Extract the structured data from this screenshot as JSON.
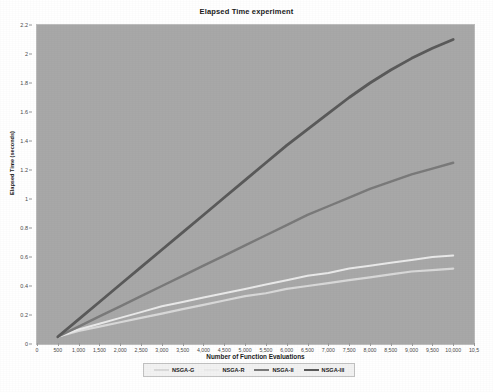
{
  "chart_data": {
    "type": "line",
    "title": "Elapsed Time experiment",
    "xlabel": "Number of Function Evaluations",
    "ylabel": "Elapsed Time (seconds)",
    "xlim": [
      0,
      10500
    ],
    "ylim": [
      0,
      2.2
    ],
    "grid": false,
    "legend_position": "bottom",
    "background_color": "#a8a8a8",
    "x_ticks": [
      0,
      500,
      1000,
      1500,
      2000,
      2500,
      3000,
      3500,
      4000,
      4500,
      5000,
      5500,
      6000,
      6500,
      7000,
      7500,
      8000,
      8500,
      9000,
      9500,
      10000,
      10500
    ],
    "x_tick_labels": [
      "0",
      "500",
      "1,000",
      "1,500",
      "2,000",
      "2,500",
      "3,000",
      "3,500",
      "4,000",
      "4,500",
      "5,000",
      "5,500",
      "6,000",
      "6,500",
      "7,000",
      "7,500",
      "8,000",
      "8,500",
      "9,000",
      "9,500",
      "10,000",
      "10,5"
    ],
    "y_ticks": [
      0,
      0.2,
      0.4,
      0.6,
      0.8,
      1.0,
      1.2,
      1.4,
      1.6,
      1.8,
      2.0,
      2.2
    ],
    "y_tick_labels": [
      "0",
      "0.2",
      "0.4",
      "0.6",
      "0.8",
      "1",
      "1.2",
      "1.4",
      "1.6",
      "1.8",
      "2",
      "2.2"
    ],
    "x": [
      500,
      1000,
      1500,
      2000,
      2500,
      3000,
      3500,
      4000,
      4500,
      5000,
      5500,
      6000,
      6500,
      7000,
      7500,
      8000,
      8500,
      9000,
      9500,
      10000
    ],
    "series": [
      {
        "name": "NSGA-G",
        "color": "#d9d9d9",
        "width": 2.2,
        "values": [
          0.05,
          0.09,
          0.12,
          0.15,
          0.18,
          0.21,
          0.24,
          0.27,
          0.3,
          0.33,
          0.35,
          0.38,
          0.4,
          0.42,
          0.44,
          0.46,
          0.48,
          0.5,
          0.51,
          0.52
        ]
      },
      {
        "name": "NSGA-R",
        "color": "#eaeaea",
        "width": 2.0,
        "values": [
          0.05,
          0.1,
          0.14,
          0.18,
          0.22,
          0.26,
          0.29,
          0.32,
          0.35,
          0.38,
          0.41,
          0.44,
          0.47,
          0.49,
          0.52,
          0.54,
          0.56,
          0.58,
          0.6,
          0.61
        ]
      },
      {
        "name": "NSGA-II",
        "color": "#7a7a7a",
        "width": 2.4,
        "values": [
          0.05,
          0.12,
          0.19,
          0.26,
          0.33,
          0.4,
          0.47,
          0.54,
          0.61,
          0.68,
          0.75,
          0.82,
          0.89,
          0.95,
          1.01,
          1.07,
          1.12,
          1.17,
          1.21,
          1.25
        ]
      },
      {
        "name": "NSGA-III",
        "color": "#5a5a5a",
        "width": 2.8,
        "values": [
          0.05,
          0.17,
          0.29,
          0.41,
          0.53,
          0.65,
          0.77,
          0.89,
          1.01,
          1.13,
          1.25,
          1.37,
          1.48,
          1.59,
          1.7,
          1.8,
          1.89,
          1.97,
          2.04,
          2.1
        ]
      }
    ]
  },
  "legend": {
    "items": [
      {
        "label": "NSGA-G"
      },
      {
        "label": "NSGA-R"
      },
      {
        "label": "NSGA-II"
      },
      {
        "label": "NSGA-III"
      }
    ]
  }
}
